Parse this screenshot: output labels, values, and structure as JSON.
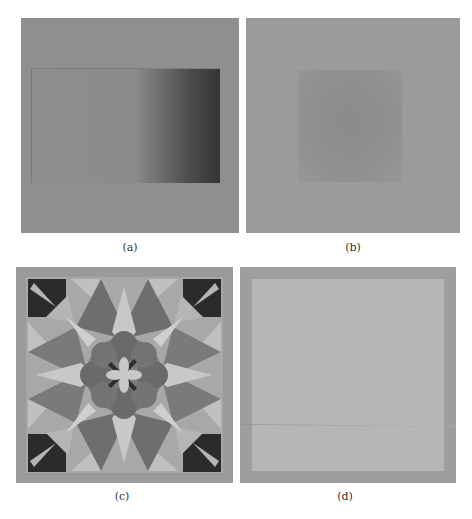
{
  "figure": {
    "panels": [
      {
        "id": "a",
        "caption": "(a)",
        "description": "grey square with inner rectangle shaded by a horizontal gradient that darkens toward the right"
      },
      {
        "id": "b",
        "caption": "(b)",
        "description": "uniform grey square with a faint slightly darker central square"
      },
      {
        "id": "c",
        "caption": "(c)",
        "description": "grayscale quilt-like star pattern with central flower"
      },
      {
        "id": "d",
        "caption": "(d)",
        "description": "grey square with a lighter inner square and border"
      }
    ],
    "colors": {
      "background": "#ffffff",
      "panel_a_base": "#8f8f8f",
      "panel_a_dark": "#353535",
      "panel_b_base": "#9b9b9b",
      "panel_b_center": "#8b8b8b",
      "panel_c_border": "#999999",
      "panel_d_border": "#9e9e9e",
      "panel_d_inner": "#b6b6b6"
    }
  }
}
